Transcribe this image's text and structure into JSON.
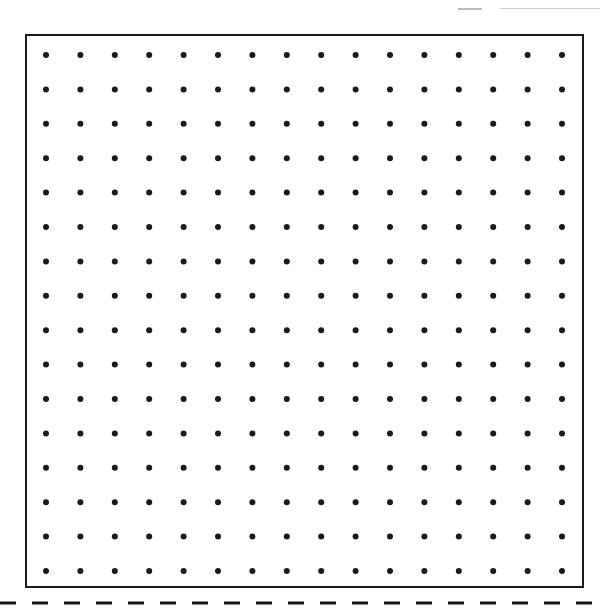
{
  "sheet": {
    "type": "dot-grid-paper",
    "rows": 16,
    "cols": 16,
    "dot_color": "#1a1a1a",
    "border_color": "#1a1a1a",
    "dash_color": "#1a1a1a",
    "grid_origin": {
      "x": 46,
      "y": 55
    },
    "spacing": 34.4,
    "dot_radius": 3
  }
}
